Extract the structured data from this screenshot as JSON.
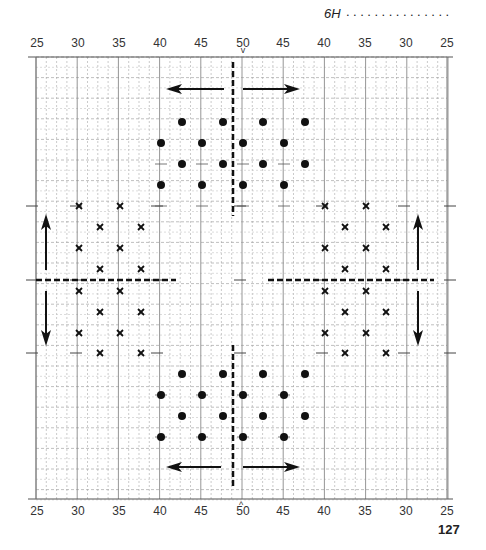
{
  "header": {
    "label": "6H",
    "dots": "...............",
    "top_marker": "v"
  },
  "axis_top": [
    "25",
    "30",
    "35",
    "40",
    "45",
    "50",
    "45",
    "40",
    "35",
    "30",
    "25"
  ],
  "axis_bottom": [
    "25",
    "30",
    "35",
    "40",
    "45",
    "50",
    "45",
    "40",
    "35",
    "30",
    "25"
  ],
  "bottom_marker": "^",
  "page_number": "127",
  "colors": {
    "ink": "#111111",
    "grid_major": "#888888",
    "grid_minor": "#bbbbbb"
  },
  "pattern": {
    "top_dots": [
      [
        182,
        122
      ],
      [
        223,
        122
      ],
      [
        263,
        122
      ],
      [
        305,
        122
      ],
      [
        161,
        143
      ],
      [
        202,
        143
      ],
      [
        243,
        143
      ],
      [
        284,
        143
      ],
      [
        182,
        164
      ],
      [
        223,
        164
      ],
      [
        263,
        164
      ],
      [
        305,
        164
      ],
      [
        161,
        185
      ],
      [
        202,
        185
      ],
      [
        243,
        185
      ],
      [
        284,
        185
      ]
    ],
    "bottom_dots": [
      [
        182,
        374
      ],
      [
        223,
        374
      ],
      [
        263,
        374
      ],
      [
        305,
        374
      ],
      [
        161,
        395
      ],
      [
        202,
        395
      ],
      [
        243,
        395
      ],
      [
        284,
        395
      ],
      [
        182,
        416
      ],
      [
        223,
        416
      ],
      [
        263,
        416
      ],
      [
        305,
        416
      ],
      [
        161,
        437
      ],
      [
        202,
        437
      ],
      [
        243,
        437
      ],
      [
        284,
        437
      ]
    ],
    "left_crosses": [
      [
        79,
        206
      ],
      [
        120,
        206
      ],
      [
        100,
        227
      ],
      [
        141,
        227
      ],
      [
        79,
        248
      ],
      [
        120,
        248
      ],
      [
        100,
        269
      ],
      [
        141,
        269
      ],
      [
        79,
        291
      ],
      [
        120,
        291
      ],
      [
        100,
        312
      ],
      [
        141,
        312
      ],
      [
        79,
        333
      ],
      [
        120,
        333
      ],
      [
        100,
        353
      ],
      [
        141,
        353
      ]
    ],
    "right_crosses": [
      [
        325,
        206
      ],
      [
        366,
        206
      ],
      [
        345,
        227
      ],
      [
        386,
        227
      ],
      [
        325,
        248
      ],
      [
        366,
        248
      ],
      [
        345,
        269
      ],
      [
        386,
        269
      ],
      [
        325,
        291
      ],
      [
        366,
        291
      ],
      [
        345,
        312
      ],
      [
        386,
        312
      ],
      [
        325,
        333
      ],
      [
        366,
        333
      ],
      [
        345,
        353
      ],
      [
        386,
        353
      ]
    ]
  }
}
